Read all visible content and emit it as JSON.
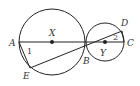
{
  "diagram": {
    "type": "two tangent circles with secants",
    "stroke_color": "#222222",
    "circles": [
      {
        "name": "X",
        "cx": 52,
        "cy": 42,
        "r": 33
      },
      {
        "name": "Y",
        "cx": 105,
        "cy": 42,
        "r": 19
      }
    ],
    "points": {
      "A": {
        "label": "A",
        "x": 19,
        "y": 42
      },
      "B": {
        "label": "B",
        "x": 86,
        "y": 42
      },
      "C": {
        "label": "C",
        "x": 124,
        "y": 42
      },
      "D": {
        "label": "D",
        "x": 122,
        "y": 31
      },
      "E": {
        "label": "E",
        "x": 30,
        "y": 68
      },
      "X": {
        "label": "X",
        "x": 52,
        "y": 42
      },
      "Y": {
        "label": "Y",
        "x": 105,
        "y": 42
      }
    },
    "segments": [
      {
        "from": "A",
        "to": "C"
      },
      {
        "from": "E",
        "to": "D"
      },
      {
        "from": "A",
        "to": "E"
      },
      {
        "from": "D",
        "to": "C"
      }
    ],
    "angle_labels": {
      "angle1": "1",
      "angle2": "2"
    }
  }
}
